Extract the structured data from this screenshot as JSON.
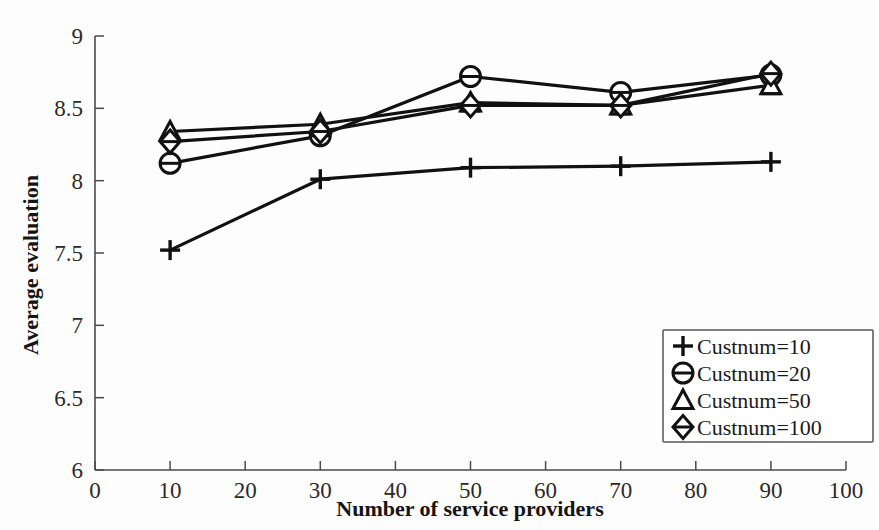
{
  "chart_data": {
    "type": "line",
    "title": "",
    "xlabel": "Number of service providers",
    "ylabel": "Average evaluation",
    "xlim": [
      0,
      100
    ],
    "ylim": [
      6,
      9
    ],
    "xticks": [
      0,
      10,
      20,
      30,
      40,
      50,
      60,
      70,
      80,
      90,
      100
    ],
    "xtick_labels": [
      "0",
      "10",
      "20",
      "30",
      "40",
      "50",
      "60",
      "70",
      "80",
      "90",
      "100"
    ],
    "yticks": [
      6,
      6.5,
      7,
      7.5,
      8,
      8.5,
      9
    ],
    "ytick_labels": [
      "6",
      "6.5",
      "7",
      "7.5",
      "8",
      "8.5",
      "9"
    ],
    "grid": false,
    "legend_position": "lower-right",
    "x": [
      10,
      30,
      50,
      70,
      90
    ],
    "series": [
      {
        "name": "Custnum=10",
        "marker": "plus",
        "values": [
          7.52,
          8.01,
          8.09,
          8.1,
          8.13
        ]
      },
      {
        "name": "Custnum=20",
        "marker": "circle",
        "values": [
          8.12,
          8.31,
          8.72,
          8.61,
          8.73
        ]
      },
      {
        "name": "Custnum=50",
        "marker": "triangle",
        "values": [
          8.34,
          8.39,
          8.54,
          8.52,
          8.66
        ]
      },
      {
        "name": "Custnum=100",
        "marker": "diamond",
        "values": [
          8.27,
          8.34,
          8.52,
          8.52,
          8.74
        ]
      }
    ]
  },
  "legend": {
    "entries": [
      {
        "label": "Custnum=10",
        "marker": "plus-marker-icon"
      },
      {
        "label": "Custnum=20",
        "marker": "circle-marker-icon"
      },
      {
        "label": "Custnum=50",
        "marker": "triangle-marker-icon"
      },
      {
        "label": "Custnum=100",
        "marker": "diamond-marker-icon"
      }
    ]
  },
  "axes": {
    "x_title": "Number of service providers",
    "y_title": "Average evaluation"
  },
  "colors": {
    "line": "#111111",
    "axis": "#4a4a4a",
    "background": "#fdfdfd",
    "legend_border": "#555555"
  }
}
